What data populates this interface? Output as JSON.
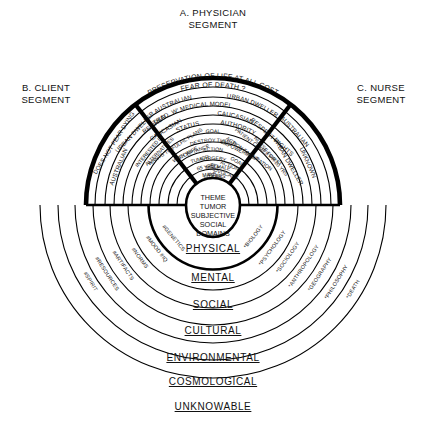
{
  "diagram": {
    "title_top": "A. PHYSICIAN",
    "title_top_2": "SEGMENT",
    "title_left": "B. CLIENT",
    "title_left_2": "SEGMENT",
    "title_right": "C. NURSE",
    "title_right_2": "SEGMENT",
    "colors": {
      "ink": "#000000",
      "background": "#ffffff"
    }
  },
  "core": {
    "lines": [
      "THEME",
      "TUMOR",
      "SUBJECTIVE",
      "SOCIAL",
      "DOMAINS"
    ]
  },
  "physician_segment": {
    "id": "A",
    "name": "A. PHYSICIAN SEGMENT",
    "outer_motto": [
      "PRESERVATION OF LIFE AT ALL COST",
      "FEAR OF DEATH ?"
    ],
    "arcs": [
      "AUSTRALIAN",
      "URBAN DWELLER",
      "TRAD. W' MEDICAL MODEL",
      "CAUCASIAN",
      "STATUS",
      "AUTHORITY",
      "GOAL",
      "DESTROY TUMOR",
      "ACTION",
      "SURGERY",
      "MALE",
      "50 YRS"
    ]
  },
  "client_segment": {
    "id": "B",
    "name": "B. CLIENT SEGMENT",
    "arcs": [
      "DOES NOT FEAR DYING",
      "AUSTRALIAN",
      "URBAN DWELLER",
      "INTERESTED IN",
      "ALTERNATIVES",
      "RETIRED",
      "CAUCASIAN",
      "WANTS TO FULFIL PLANS",
      "WITH WIFE",
      "ACCEPTANCE",
      "TUMOR",
      "65 YRS",
      "MALE"
    ]
  },
  "nurse_segment": {
    "id": "C",
    "name": "C. NURSE SEGMENT",
    "arcs": [
      "AUSTRALIAN",
      "UNKNOWN",
      "URBAN DWELLER",
      "RESPECT RIGHTS",
      "NURSE FOR 20 YRS",
      "PATIENT COMES FIRST",
      "ACTION FACILITATION",
      "EMPOWERMENT",
      "GOAL",
      "ACTION",
      "ADVOCACY",
      "FEMALE",
      "45 YRS"
    ]
  },
  "rings": [
    {
      "label": "PHYSICAL",
      "left_science": "*BIOLOGY",
      "right_science": "#GENETICS"
    },
    {
      "label": "MENTAL",
      "left_science": "*PSYCHOLOGY",
      "right_science": "#MOOD #IQ"
    },
    {
      "label": "SOCIAL",
      "left_science": "*SOCIOLOGY",
      "right_science": "#NORMS"
    },
    {
      "label": "CULTURAL",
      "left_science": "*ANTHROPOLOGY",
      "right_science": "#ARTIFACTS"
    },
    {
      "label": "ENVIRONMENTAL",
      "left_science": "*GEOGRAPHY",
      "right_science": "#RESOURCES"
    },
    {
      "label": "COSMOLOGICAL",
      "left_science": "*PHILOSOPHY",
      "right_science": "#SPIRIT"
    },
    {
      "label": "UNKNOWABLE",
      "left_science": "*DEATH",
      "right_science": ""
    }
  ]
}
